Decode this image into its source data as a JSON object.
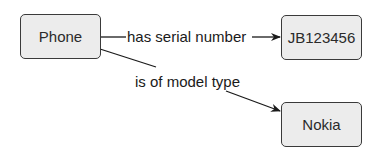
{
  "diagram": {
    "nodes": [
      {
        "id": "phone",
        "label": "Phone"
      },
      {
        "id": "serial",
        "label": "JB123456"
      },
      {
        "id": "model",
        "label": "Nokia"
      }
    ],
    "edges": [
      {
        "from": "phone",
        "to": "serial",
        "label": "has serial number"
      },
      {
        "from": "phone",
        "to": "model",
        "label": "is of model type"
      }
    ]
  },
  "colors": {
    "node_fill": "#ececec",
    "node_border": "#3a3a3a",
    "edge": "#1a1a1a"
  }
}
